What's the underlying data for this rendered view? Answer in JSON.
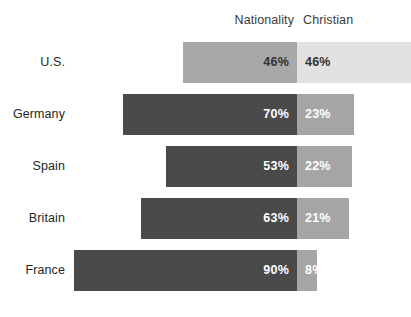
{
  "chart_data": {
    "type": "bar",
    "subtype": "diverging-stacked-bar",
    "title": "",
    "xlabel": "",
    "ylabel": "",
    "grid": false,
    "legend_position": "top",
    "categories": [
      "U.S.",
      "Germany",
      "Spain",
      "Britain",
      "France"
    ],
    "series": [
      {
        "name": "Nationality",
        "values": [
          46,
          70,
          53,
          63,
          90
        ],
        "labels": [
          "46%",
          "70%",
          "53%",
          "63%",
          "90%"
        ],
        "direction": "left",
        "color": "#4a4a4a",
        "highlight_color": "#a8a8a8",
        "value_color": "#ffffff",
        "highlight_value_color": "#333333"
      },
      {
        "name": "Christian",
        "values": [
          46,
          23,
          22,
          21,
          8
        ],
        "labels": [
          "46%",
          "23%",
          "22%",
          "21%",
          "8%"
        ],
        "direction": "right",
        "color": "#a5a5a5",
        "highlight_color": "#e2e2e2",
        "value_color": "#ffffff",
        "highlight_value_color": "#333333"
      }
    ],
    "highlighted_category": "U.S.",
    "value_unit": "%",
    "axis_max": 100
  },
  "headers": {
    "nationality": "Nationality",
    "christian": "Christian"
  },
  "rows": [
    {
      "label": "U.S.",
      "left_value": "46%",
      "right_value": "46%",
      "left_pct": 46,
      "right_pct": 46,
      "highlight": true
    },
    {
      "label": "Germany",
      "left_value": "70%",
      "right_value": "23%",
      "left_pct": 70,
      "right_pct": 23,
      "highlight": false
    },
    {
      "label": "Spain",
      "left_value": "53%",
      "right_value": "22%",
      "left_pct": 53,
      "right_pct": 22,
      "highlight": false
    },
    {
      "label": "Britain",
      "left_value": "63%",
      "right_value": "21%",
      "left_pct": 63,
      "right_pct": 21,
      "highlight": false
    },
    {
      "label": "France",
      "left_value": "90%",
      "right_value": "8%",
      "left_pct": 90,
      "right_pct": 8,
      "highlight": false
    }
  ],
  "colors": {
    "background": "#ffffff",
    "bar_dark": "#4a4a4a",
    "bar_medium": "#a5a5a5",
    "bar_highlight_dark": "#a8a8a8",
    "bar_highlight_light": "#e2e2e2",
    "label_text": "#262626",
    "header_text": "#3b3b3b",
    "value_text_light": "#ffffff",
    "value_text_dark": "#333333"
  }
}
